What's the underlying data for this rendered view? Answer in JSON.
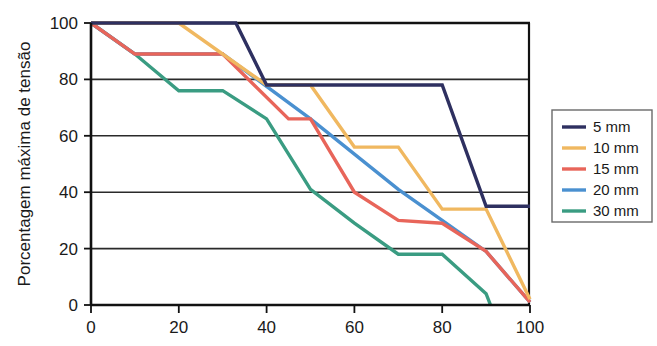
{
  "chart_data": {
    "type": "line",
    "title": "",
    "subtitle": "",
    "xlabel": "",
    "ylabel": "Porcentagem máxima de tensão",
    "xlim": [
      0,
      100
    ],
    "ylim": [
      0,
      100
    ],
    "xticks": [
      0,
      20,
      40,
      60,
      80,
      100
    ],
    "yticks": [
      0,
      20,
      40,
      60,
      80,
      100
    ],
    "xtick_labels": [
      "0",
      "20",
      "40",
      "60",
      "80",
      "100"
    ],
    "ytick_labels": [
      "0",
      "20",
      "40",
      "60",
      "80",
      "100"
    ],
    "grid": "horizontal",
    "legend_position": "right",
    "series": [
      {
        "name": "5 mm",
        "color": "#2e3060",
        "x": [
          0,
          33,
          40,
          80,
          90,
          100
        ],
        "y": [
          100,
          100,
          78,
          78,
          35,
          35
        ]
      },
      {
        "name": "10 mm",
        "color": "#f0b860",
        "x": [
          0,
          20,
          40,
          50,
          60,
          70,
          80,
          90,
          100
        ],
        "y": [
          100,
          100,
          78,
          78,
          56,
          56,
          34,
          34,
          2
        ]
      },
      {
        "name": "15 mm",
        "color": "#e8655a",
        "x": [
          0,
          10,
          30,
          45,
          50,
          60,
          70,
          80,
          90,
          100
        ],
        "y": [
          100,
          89,
          89,
          66,
          66,
          40,
          30,
          29,
          19,
          1
        ]
      },
      {
        "name": "20 mm",
        "color": "#4a90d0",
        "x": [
          0,
          10,
          30,
          50,
          70,
          80,
          90,
          100
        ],
        "y": [
          100,
          89,
          89,
          66,
          41,
          30,
          19,
          1
        ]
      },
      {
        "name": "30 mm",
        "color": "#3a9c82",
        "x": [
          0,
          10,
          20,
          30,
          40,
          50,
          60,
          70,
          80,
          90,
          91
        ],
        "y": [
          100,
          89,
          76,
          76,
          66,
          41,
          29,
          18,
          18,
          4,
          0
        ]
      }
    ]
  },
  "legend": {
    "entries": [
      {
        "label": "5 mm",
        "color": "#2e3060"
      },
      {
        "label": "10 mm",
        "color": "#f0b860"
      },
      {
        "label": "15 mm",
        "color": "#e8655a"
      },
      {
        "label": "20 mm",
        "color": "#4a90d0"
      },
      {
        "label": "30 mm",
        "color": "#3a9c82"
      }
    ]
  },
  "axes": {
    "y_title": "Porcentagem máxima de tensão",
    "x_title": "",
    "y_labels": [
      "100",
      "80",
      "60",
      "40",
      "20",
      "0"
    ],
    "x_labels": [
      "0",
      "20",
      "40",
      "60",
      "80",
      "100"
    ]
  },
  "colors": {
    "axis": "#111111",
    "grid": "#2a2a2a",
    "background": "#ffffff",
    "text": "#1a1a1a"
  }
}
